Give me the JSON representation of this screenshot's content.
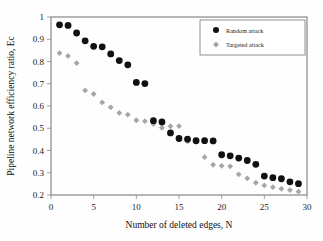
{
  "chart_data": {
    "type": "scatter",
    "title": "",
    "xlabel": "Number of deleted edges, N",
    "ylabel": "Pipeline network efficiency ratio, Ec",
    "xlim": [
      0,
      30
    ],
    "ylim": [
      0.2,
      1
    ],
    "xticks": [
      0,
      5,
      10,
      15,
      20,
      25,
      30
    ],
    "yticks": [
      0.2,
      0.3,
      0.4,
      0.5,
      0.6,
      0.7,
      0.8,
      0.9,
      1
    ],
    "xtick_labels": [
      "0",
      "5",
      "10",
      "15",
      "20",
      "25",
      "30"
    ],
    "ytick_labels": [
      "0.2",
      "0.3",
      "0.4",
      "0.5",
      "0.6",
      "0.7",
      "0.8",
      "0.9",
      "1"
    ],
    "grid": false,
    "legend_position": "top-right",
    "x": [
      1,
      2,
      3,
      4,
      5,
      6,
      7,
      8,
      9,
      10,
      11,
      12,
      13,
      14,
      15,
      16,
      17,
      18,
      19,
      20,
      21,
      22,
      23,
      24,
      25,
      26,
      27,
      28,
      29
    ],
    "series": [
      {
        "name": "Random attack",
        "marker": "circle",
        "color": "#111111",
        "values": [
          0.965,
          0.962,
          0.928,
          0.893,
          0.868,
          0.866,
          0.834,
          0.804,
          0.785,
          0.706,
          0.701,
          0.534,
          0.528,
          0.479,
          0.454,
          0.451,
          0.444,
          0.444,
          0.443,
          0.381,
          0.376,
          0.366,
          0.355,
          0.338,
          0.285,
          0.278,
          0.273,
          0.259,
          0.251
        ]
      },
      {
        "name": "Targeted attack",
        "marker": "diamond",
        "color": "#a6a6a6",
        "values": [
          0.838,
          0.825,
          0.793,
          0.67,
          0.654,
          0.616,
          0.594,
          0.569,
          0.561,
          0.536,
          0.532,
          0.519,
          0.502,
          0.509,
          0.51,
          0.441,
          0.438,
          0.37,
          0.336,
          0.331,
          0.329,
          0.293,
          0.275,
          0.255,
          0.243,
          0.235,
          0.228,
          0.222,
          0.215
        ]
      }
    ]
  },
  "legend": {
    "entries": [
      {
        "label": "Random attack",
        "marker": "circle",
        "color": "#111111"
      },
      {
        "label": "Targeted attack",
        "marker": "diamond",
        "color": "#a6a6a6"
      }
    ]
  }
}
